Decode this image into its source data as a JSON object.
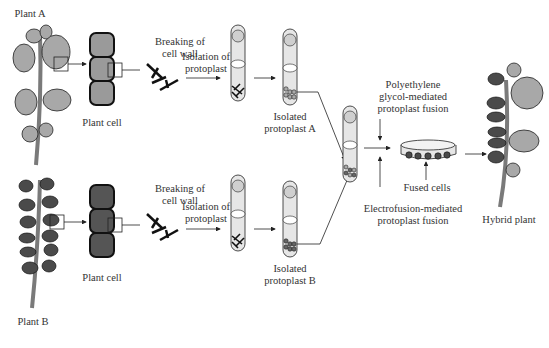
{
  "colors": {
    "leaf_light": "#a8a8a8",
    "leaf_dark": "#4a4a4a",
    "stem": "#7a7a7a",
    "cell_a": "#9a9a9a",
    "cell_b": "#555555",
    "tube_fill": "#e6e6e6",
    "line": "#222222"
  },
  "labels": {
    "plant_a": "Plant A",
    "plant_b": "Plant B",
    "plant_cell_a": "Plant cell",
    "plant_cell_b": "Plant cell",
    "breaking_a_line1": "Breaking of",
    "breaking_a_line2": "cell wall",
    "breaking_b_line1": "Breaking of",
    "breaking_b_line2": "cell wall",
    "isolation_a_line1": "Isolation of",
    "isolation_a_line2": "protoplast",
    "isolation_b_line1": "Isolation of",
    "isolation_b_line2": "protoplast",
    "isolated_a_line1": "Isolated",
    "isolated_a_line2": "protoplast A",
    "isolated_b_line1": "Isolated",
    "isolated_b_line2": "protoplast B",
    "peg_line1": "Polyethylene",
    "peg_line2": "glycol-mediated",
    "peg_line3": "protoplast fusion",
    "fused_cells": "Fused cells",
    "electro_line1": "Electrofusion-mediated",
    "electro_line2": "protoplast fusion",
    "hybrid_plant": "Hybrid plant"
  }
}
